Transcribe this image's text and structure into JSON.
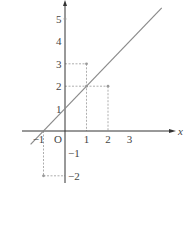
{
  "chart_data": {
    "type": "line",
    "title": "",
    "xlabel": "x",
    "ylabel": "",
    "xlim": [
      -1.4,
      3.8
    ],
    "ylim": [
      -2.3,
      5.7
    ],
    "grid": false,
    "x_ticks": [
      "−1",
      "O",
      "1",
      "2",
      "3"
    ],
    "y_ticks": [
      "5",
      "4",
      "3",
      "2",
      "1",
      "−1",
      "−2"
    ],
    "series": [
      {
        "name": "line",
        "equation": "y = x + 1",
        "x": [
          -1.6,
          4.5
        ],
        "y": [
          -0.6,
          5.5
        ]
      }
    ],
    "points": [
      {
        "x": 0,
        "y": 5
      },
      {
        "x": 1,
        "y": 3
      },
      {
        "x": 1,
        "y": 2
      },
      {
        "x": 2,
        "y": 2
      },
      {
        "x": -1,
        "y": -2
      }
    ],
    "dashed_guides": [
      {
        "from": [
          0,
          3
        ],
        "to": [
          1,
          3
        ]
      },
      {
        "from": [
          1,
          3
        ],
        "to": [
          1,
          0
        ]
      },
      {
        "from": [
          0,
          2
        ],
        "to": [
          2,
          2
        ]
      },
      {
        "from": [
          2,
          2
        ],
        "to": [
          2,
          0
        ]
      },
      {
        "from": [
          -1,
          0
        ],
        "to": [
          -1,
          -2
        ]
      },
      {
        "from": [
          -1,
          -2
        ],
        "to": [
          0,
          -2
        ]
      }
    ],
    "colors": {
      "axis": "#333333",
      "line": "#8a8a8a",
      "guide": "#999999",
      "point": "#999999"
    }
  }
}
